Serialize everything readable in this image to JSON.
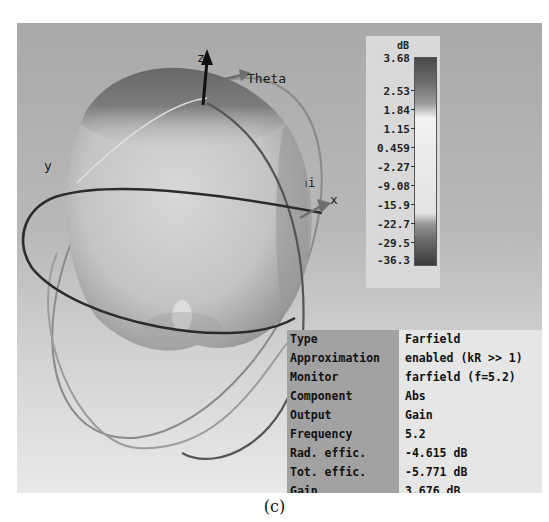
{
  "viewport": {
    "axes": {
      "z": "z",
      "y": "y",
      "x": "x",
      "theta": "Theta",
      "phi": "Phi"
    },
    "background_color": "#b5b5b5"
  },
  "legend": {
    "unit": "dB",
    "ticks": [
      "3.68",
      "2.53",
      "1.84",
      "1.15",
      "0.459",
      "-2.27",
      "-9.08",
      "-15.9",
      "-22.7",
      "-29.5",
      "-36.3"
    ]
  },
  "info_table": {
    "rows": [
      {
        "key": "Type",
        "value": "Farfield"
      },
      {
        "key": "Approximation",
        "value": "enabled (kR >> 1)"
      },
      {
        "key": "Monitor",
        "value": "farfield (f=5.2)"
      },
      {
        "key": "Component",
        "value": "Abs"
      },
      {
        "key": "Output",
        "value": "Gain"
      },
      {
        "key": "Frequency",
        "value": "5.2"
      },
      {
        "key": "Rad. effic.",
        "value": "-4.615 dB"
      },
      {
        "key": "Tot. effic.",
        "value": "-5.771 dB"
      },
      {
        "key": "Gain",
        "value": "3.676 dB"
      }
    ]
  },
  "caption": "(c)"
}
